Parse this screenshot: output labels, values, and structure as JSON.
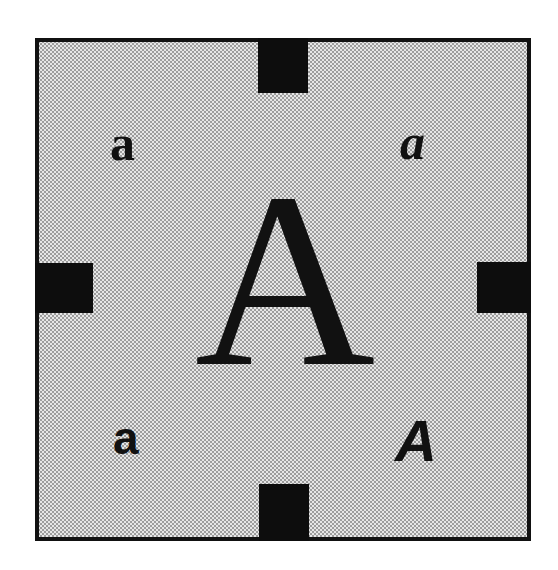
{
  "diagram": {
    "frame": {
      "border_color": "#111111",
      "fill_color": "#e6e6e6",
      "fill_pattern": "halftone-dots"
    },
    "tabs": {
      "color": "#0d0d0d",
      "positions": [
        "top",
        "right",
        "bottom",
        "left"
      ]
    },
    "center_glyph": {
      "text": "A",
      "style": "serif-regular"
    },
    "corner_glyphs": {
      "top_left": {
        "text": "a",
        "style": "serif-bold"
      },
      "top_right": {
        "text": "a",
        "style": "serif-bold-italic"
      },
      "bottom_left": {
        "text": "a",
        "style": "sans-bold"
      },
      "bottom_right": {
        "text": "A",
        "style": "sans-bold-oblique"
      }
    }
  }
}
